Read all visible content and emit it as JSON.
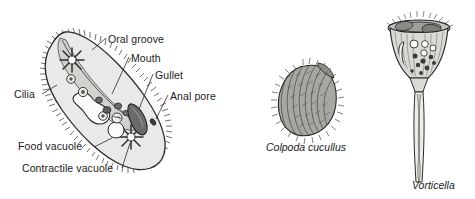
{
  "figure": {
    "background_color": "#ffffff",
    "ink_color": "#1a1a1a",
    "cytoplasm_color": "#e9e9e7",
    "groove_color": "#d2d2cf",
    "organelle_dark_color": "#6a6a68",
    "organelle_mid_color": "#9a9a97",
    "vacuole_color": "#fbfbfa"
  },
  "specimens": [
    {
      "id": "paramecium",
      "name": "paramecium-diagram",
      "caption": "",
      "labels": [
        {
          "id": "oral-groove",
          "text": "Oral groove",
          "x": 108,
          "y": 34
        },
        {
          "id": "mouth",
          "text": "Mouth",
          "x": 131,
          "y": 53
        },
        {
          "id": "gullet",
          "text": "Gullet",
          "x": 155,
          "y": 70
        },
        {
          "id": "anal-pore",
          "text": "Anal pore",
          "x": 170,
          "y": 91
        },
        {
          "id": "cilia",
          "text": "Cilia",
          "x": 14,
          "y": 89
        },
        {
          "id": "food-vacuole",
          "text": "Food vacuole",
          "x": 18,
          "y": 141
        },
        {
          "id": "contractile-vacuole",
          "text": "Contractile vacuole",
          "x": 22,
          "y": 163
        }
      ]
    },
    {
      "id": "colpoda",
      "name": "colpoda-drawing",
      "caption": "Colpoda cucullus",
      "caption_x": 266,
      "caption_y": 142,
      "labels": []
    },
    {
      "id": "vorticella",
      "name": "vorticella-drawing",
      "caption": "Vorticella",
      "caption_x": 412,
      "caption_y": 180,
      "labels": []
    }
  ]
}
